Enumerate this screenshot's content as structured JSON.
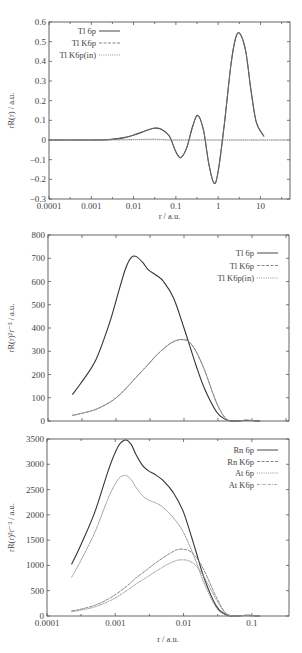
{
  "chart_data": [
    {
      "type": "line",
      "title": "",
      "xlabel": "r / a.u.",
      "ylabel": "rR(r) / a.u.",
      "xscale": "log",
      "xlim": [
        0.0001,
        50
      ],
      "ylim": [
        -0.3,
        0.6
      ],
      "xticks": [
        0.0001,
        0.001,
        0.01,
        0.1,
        1,
        10
      ],
      "xtick_labels": [
        "0.0001",
        "0.001",
        "0.01",
        "0.1",
        "1",
        "10"
      ],
      "yticks": [
        -0.3,
        -0.2,
        -0.1,
        0,
        0.1,
        0.2,
        0.3,
        0.4,
        0.5,
        0.6
      ],
      "ytick_labels": [
        "-0.3",
        "-0.2",
        "-0.1",
        "0",
        "0.1",
        "0.2",
        "0.3",
        "0.4",
        "0.5",
        "0.6"
      ],
      "legend_position": "upper left",
      "grid": false,
      "series": [
        {
          "name": "Tl 6p",
          "style": "solid",
          "color": "#333333",
          "x": [
            0.0001,
            0.001,
            0.003,
            0.006,
            0.01,
            0.02,
            0.03,
            0.045,
            0.07,
            0.1,
            0.13,
            0.18,
            0.25,
            0.33,
            0.45,
            0.6,
            0.8,
            1.0,
            1.4,
            2.0,
            2.6,
            3.3,
            4.5,
            6.0,
            8.0,
            12.0
          ],
          "y": [
            0.0,
            0.0,
            0.003,
            0.012,
            0.025,
            0.048,
            0.06,
            0.055,
            0.02,
            -0.06,
            -0.09,
            -0.04,
            0.07,
            0.125,
            0.05,
            -0.12,
            -0.22,
            -0.16,
            0.08,
            0.38,
            0.52,
            0.54,
            0.45,
            0.25,
            0.09,
            0.02
          ]
        },
        {
          "name": "Tl K6p",
          "style": "dashed",
          "color": "#777777",
          "x": [
            0.0001,
            0.001,
            0.003,
            0.006,
            0.01,
            0.02,
            0.03,
            0.045,
            0.07,
            0.1,
            0.13,
            0.18,
            0.25,
            0.33,
            0.45,
            0.6,
            0.8,
            1.0,
            1.4,
            2.0,
            2.6,
            3.3,
            4.5,
            6.0,
            8.0,
            12.0
          ],
          "y": [
            0.0,
            0.0,
            0.003,
            0.012,
            0.025,
            0.048,
            0.06,
            0.055,
            0.02,
            -0.06,
            -0.09,
            -0.04,
            0.07,
            0.125,
            0.05,
            -0.12,
            -0.22,
            -0.16,
            0.08,
            0.38,
            0.52,
            0.54,
            0.45,
            0.25,
            0.09,
            0.02
          ]
        },
        {
          "name": "Tl K6p(in)",
          "style": "dotted",
          "color": "#888888",
          "x": [
            0.0001,
            0.001,
            0.01,
            0.03,
            0.06,
            0.1,
            1,
            10,
            50
          ],
          "y": [
            0.0,
            0.0,
            0.002,
            0.004,
            0.001,
            0.0,
            0.0,
            0.0,
            0.0
          ]
        }
      ]
    },
    {
      "type": "line",
      "title": "",
      "xlabel": "",
      "ylabel": "rR(r)²r⁻³ / a.u.",
      "xscale": "log",
      "xlim": [
        0.0001,
        0.35
      ],
      "ylim": [
        0,
        800
      ],
      "xticks": [
        0.0001,
        0.000316,
        0.001,
        0.00316,
        0.01,
        0.0316,
        0.1,
        0.316
      ],
      "xtick_labels": [],
      "yticks": [
        0,
        100,
        200,
        300,
        400,
        500,
        600,
        700,
        800
      ],
      "ytick_labels": [
        "0",
        "100",
        "200",
        "300",
        "400",
        "500",
        "600",
        "700",
        "800"
      ],
      "legend_position": "upper right",
      "grid": false,
      "series": [
        {
          "name": "Tl 6p",
          "style": "solid",
          "color": "#333333",
          "x": [
            0.00023,
            0.0003,
            0.0005,
            0.0008,
            0.0011,
            0.0014,
            0.0017,
            0.002,
            0.0025,
            0.003,
            0.004,
            0.005,
            0.007,
            0.01,
            0.015,
            0.02,
            0.03,
            0.04,
            0.05,
            0.06,
            0.08,
            0.1,
            0.13
          ],
          "y": [
            115,
            160,
            260,
            420,
            560,
            660,
            705,
            707,
            680,
            650,
            625,
            600,
            530,
            400,
            240,
            140,
            40,
            8,
            0,
            0,
            3,
            2,
            0
          ]
        },
        {
          "name": "Tl K6p",
          "style": "dashed",
          "color": "#777777",
          "x": [
            0.00023,
            0.0003,
            0.0005,
            0.0008,
            0.0011,
            0.0015,
            0.002,
            0.003,
            0.004,
            0.006,
            0.008,
            0.01,
            0.012,
            0.015,
            0.02,
            0.03,
            0.04,
            0.05,
            0.06,
            0.08,
            0.1,
            0.13
          ],
          "y": [
            25,
            32,
            50,
            80,
            110,
            150,
            190,
            245,
            285,
            330,
            348,
            350,
            340,
            300,
            220,
            80,
            15,
            0,
            0,
            3,
            2,
            0
          ]
        },
        {
          "name": "Tl K6p(in)",
          "style": "dotted",
          "color": "#888888",
          "x": [
            0.00023,
            0.0003,
            0.0005,
            0.0008,
            0.0011,
            0.0015,
            0.002,
            0.003,
            0.004,
            0.006,
            0.008,
            0.01,
            0.012,
            0.015,
            0.02,
            0.03,
            0.04,
            0.05,
            0.06,
            0.08,
            0.1,
            0.13
          ],
          "y": [
            24,
            31,
            49,
            79,
            109,
            149,
            189,
            244,
            284,
            329,
            347,
            349,
            339,
            299,
            219,
            79,
            14,
            0,
            0,
            3,
            2,
            0
          ]
        }
      ]
    },
    {
      "type": "line",
      "title": "",
      "xlabel": "r / a.u.",
      "ylabel": "rR(r)²r⁻³ / a.u.",
      "xscale": "log",
      "xlim": [
        0.0001,
        0.35
      ],
      "ylim": [
        0,
        3500
      ],
      "xticks": [
        0.0001,
        0.001,
        0.01,
        0.1
      ],
      "xtick_labels": [
        "0.0001",
        "0.001",
        "0.01",
        "0.1"
      ],
      "yticks": [
        0,
        500,
        1000,
        1500,
        2000,
        2500,
        3000,
        3500
      ],
      "ytick_labels": [
        "0",
        "500",
        "1000",
        "1500",
        "2000",
        "2500",
        "3000",
        "3500"
      ],
      "legend_position": "upper right",
      "grid": false,
      "series": [
        {
          "name": "Rn 6p",
          "style": "solid",
          "color": "#333333",
          "x": [
            0.00023,
            0.0003,
            0.0005,
            0.0008,
            0.0011,
            0.0014,
            0.0017,
            0.002,
            0.0025,
            0.003,
            0.004,
            0.005,
            0.007,
            0.01,
            0.015,
            0.02,
            0.03,
            0.04,
            0.05,
            0.06,
            0.08,
            0.1,
            0.13
          ],
          "y": [
            1030,
            1350,
            2050,
            2900,
            3350,
            3480,
            3400,
            3200,
            2980,
            2880,
            2780,
            2680,
            2450,
            2050,
            1300,
            750,
            200,
            40,
            0,
            0,
            15,
            10,
            0
          ]
        },
        {
          "name": "Rn K6p",
          "style": "dashed",
          "color": "#777777",
          "x": [
            0.00023,
            0.0003,
            0.0005,
            0.0008,
            0.0011,
            0.0015,
            0.002,
            0.003,
            0.004,
            0.006,
            0.008,
            0.01,
            0.012,
            0.015,
            0.02,
            0.03,
            0.04,
            0.05,
            0.06,
            0.08,
            0.1,
            0.13
          ],
          "y": [
            100,
            130,
            210,
            340,
            460,
            600,
            750,
            930,
            1060,
            1220,
            1310,
            1320,
            1290,
            1180,
            900,
            380,
            80,
            5,
            0,
            10,
            5,
            0
          ]
        },
        {
          "name": "At 6p",
          "style": "dotted",
          "color": "#888888",
          "x": [
            0.00023,
            0.0003,
            0.0005,
            0.0008,
            0.0011,
            0.0014,
            0.0017,
            0.002,
            0.0025,
            0.003,
            0.004,
            0.005,
            0.007,
            0.01,
            0.015,
            0.02,
            0.03,
            0.04,
            0.05,
            0.06,
            0.08,
            0.1,
            0.13
          ],
          "y": [
            770,
            1050,
            1650,
            2350,
            2700,
            2780,
            2700,
            2550,
            2380,
            2300,
            2230,
            2150,
            1950,
            1650,
            1100,
            650,
            170,
            30,
            0,
            0,
            12,
            8,
            0
          ]
        },
        {
          "name": "At K6p",
          "style": "dashdot",
          "color": "#999999",
          "x": [
            0.00023,
            0.0003,
            0.0005,
            0.0008,
            0.0011,
            0.0015,
            0.002,
            0.003,
            0.004,
            0.006,
            0.008,
            0.01,
            0.012,
            0.015,
            0.02,
            0.03,
            0.04,
            0.05,
            0.06,
            0.08,
            0.1,
            0.13
          ],
          "y": [
            85,
            110,
            180,
            290,
            390,
            510,
            630,
            780,
            890,
            1030,
            1100,
            1110,
            1090,
            1000,
            770,
            330,
            70,
            5,
            0,
            8,
            4,
            0
          ]
        }
      ]
    }
  ]
}
